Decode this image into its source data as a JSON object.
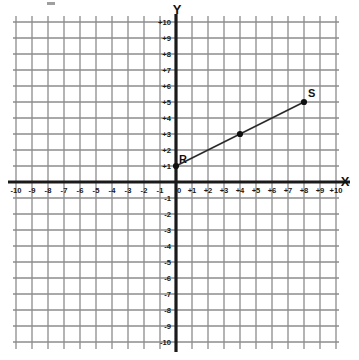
{
  "chart_data": {
    "type": "scatter",
    "title": "",
    "subtitle": "",
    "xlabel": "X",
    "ylabel": "Y",
    "xlim": [
      -10,
      10
    ],
    "ylim": [
      -10,
      10
    ],
    "grid": true,
    "grid_step": 1,
    "legend": "none",
    "x_tick_labels": [
      "-10",
      "-9",
      "-8",
      "-7",
      "-6",
      "-5",
      "-4",
      "-3",
      "-2",
      "-1",
      "0",
      "+1",
      "+2",
      "+3",
      "+4",
      "+5",
      "+6",
      "+7",
      "+8",
      "+9",
      "+10"
    ],
    "x_tick_values": [
      -10,
      -9,
      -8,
      -7,
      -6,
      -5,
      -4,
      -3,
      -2,
      -1,
      0,
      1,
      2,
      3,
      4,
      5,
      6,
      7,
      8,
      9,
      10
    ],
    "y_tick_labels": [
      "+10",
      "+9",
      "+8",
      "+7",
      "+6",
      "+5",
      "+4",
      "+3",
      "+2",
      "+1",
      "-1",
      "-2",
      "-3",
      "-4",
      "-5",
      "-6",
      "-7",
      "-8",
      "-9",
      "-10"
    ],
    "y_tick_values": [
      10,
      9,
      8,
      7,
      6,
      5,
      4,
      3,
      2,
      1,
      -1,
      -2,
      -3,
      -4,
      -5,
      -6,
      -7,
      -8,
      -9,
      -10
    ],
    "series": [
      {
        "name": "segment-RS",
        "type": "line-segment",
        "points": [
          {
            "label": "R",
            "x": 0,
            "y": 1,
            "label_dx": 3,
            "label_dy": -3
          },
          {
            "label": "",
            "x": 4,
            "y": 3,
            "label_dx": 0,
            "label_dy": 0
          },
          {
            "label": "S",
            "x": 8,
            "y": 5,
            "label_dx": 4,
            "label_dy": -5
          }
        ]
      }
    ],
    "annotations": [
      {
        "text": "R",
        "x": 0,
        "y": 1
      },
      {
        "text": "S",
        "x": 8,
        "y": 5
      }
    ]
  },
  "colors": {
    "background": "#ffffff",
    "grid_line": "#8c8c8c",
    "axis_line": "#1a1a1a",
    "segment_line": "#2b2b2b",
    "point_fill": "#111111",
    "label_text": "#1a1a1a"
  },
  "axes": {
    "x_axis_name": "X",
    "y_axis_name": "Y",
    "origin_label": "0"
  }
}
